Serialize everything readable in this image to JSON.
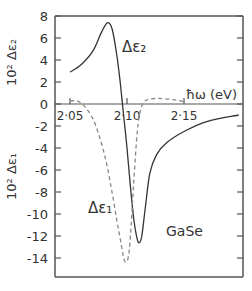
{
  "chart_data": {
    "type": "line",
    "title": "",
    "xlabel": "ħω (eV)",
    "ylabel_upper": "10² Δε₂",
    "ylabel_lower": "10² Δε₁",
    "xlim": [
      2.037,
      2.202
    ],
    "ylim": [
      -15.5,
      8
    ],
    "x_ticks": [
      2.05,
      2.1,
      2.15
    ],
    "x_tick_labels": [
      "2·05",
      "2·10",
      "2·15"
    ],
    "y_ticks": [
      8,
      6,
      4,
      2,
      0,
      -2,
      -4,
      -6,
      -8,
      -10,
      -12,
      -14
    ],
    "y_tick_labels": [
      "8",
      "6",
      "4",
      "2",
      "0",
      "-2",
      "-4",
      "-6",
      "-8",
      "-10",
      "-12",
      "-14"
    ],
    "grid": false,
    "annotations": [
      "Δε₂",
      "Δε₁",
      "GaSe"
    ],
    "series": [
      {
        "name": "Δε₂ (solid)",
        "style": "solid",
        "x": [
          2.05,
          2.06,
          2.07,
          2.078,
          2.083,
          2.087,
          2.091,
          2.094,
          2.097,
          2.1,
          2.103,
          2.106,
          2.109,
          2.111,
          2.113,
          2.116,
          2.12,
          2.126,
          2.135,
          2.15,
          2.17,
          2.198
        ],
        "values": [
          2.9,
          3.6,
          4.8,
          6.6,
          7.4,
          6.8,
          4.5,
          2.0,
          -1.0,
          -4.0,
          -7.5,
          -10.5,
          -12.3,
          -12.6,
          -12.0,
          -9.5,
          -6.3,
          -4.6,
          -3.5,
          -2.5,
          -1.6,
          -1.0
        ]
      },
      {
        "name": "Δε₁ (dashed)",
        "style": "dashed",
        "x": [
          2.05,
          2.058,
          2.065,
          2.072,
          2.08,
          2.086,
          2.091,
          2.095,
          2.098,
          2.101,
          2.103,
          2.106,
          2.109,
          2.112,
          2.116,
          2.125,
          2.14,
          2.15
        ],
        "values": [
          0.3,
          0.2,
          -0.5,
          -1.8,
          -4.5,
          -7.5,
          -10.5,
          -12.8,
          -14.3,
          -14.0,
          -12.0,
          -7.0,
          -2.5,
          -0.5,
          0.3,
          0.5,
          0.4,
          0.2
        ]
      }
    ]
  }
}
